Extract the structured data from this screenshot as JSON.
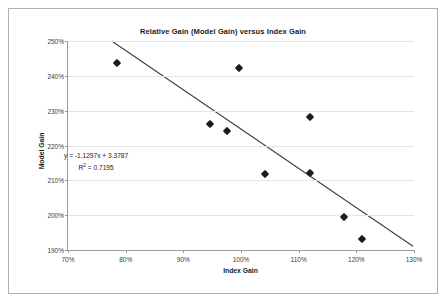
{
  "chart_data": {
    "type": "scatter",
    "title": "Relative Gain (Model Gain) versus Index Gain",
    "xlabel": "Index Gain",
    "ylabel": "Model Gain",
    "xlim": [
      70,
      130
    ],
    "ylim": [
      190,
      250
    ],
    "xticks": [
      "70%",
      "80%",
      "90%",
      "100%",
      "110%",
      "120%",
      "130%"
    ],
    "xtick_values": [
      70,
      80,
      90,
      100,
      110,
      120,
      130
    ],
    "yticks": [
      "190%",
      "200%",
      "210%",
      "220%",
      "230%",
      "240%",
      "250%"
    ],
    "ytick_values": [
      190,
      200,
      210,
      220,
      230,
      240,
      250
    ],
    "grid": true,
    "legend": "none",
    "points": [
      {
        "x": 78.5,
        "y": 243.8
      },
      {
        "x": 99.6,
        "y": 242.3
      },
      {
        "x": 94.6,
        "y": 226.2
      },
      {
        "x": 97.6,
        "y": 224.2
      },
      {
        "x": 111.9,
        "y": 228.2
      },
      {
        "x": 104.1,
        "y": 211.8
      },
      {
        "x": 111.9,
        "y": 212.1
      },
      {
        "x": 117.9,
        "y": 199.5
      },
      {
        "x": 120.9,
        "y": 193.3
      }
    ],
    "trendline": {
      "equation": "y = -1.1297x + 3.3787",
      "slope": -1.1297,
      "intercept": 3.3787,
      "r_squared_label": "R",
      "r_squared_exponent": "2",
      "r_squared_value": " = 0.7195",
      "x_start": 77.6,
      "y_start": 250,
      "x_end": 130,
      "y_end": 190.8
    },
    "series_color": "#1c1c1c",
    "trendline_color": "#3c3c3c",
    "gridline_color": "#e4e4e4",
    "axis_color": "#9a9a9a",
    "background_color": "#ffffff"
  }
}
